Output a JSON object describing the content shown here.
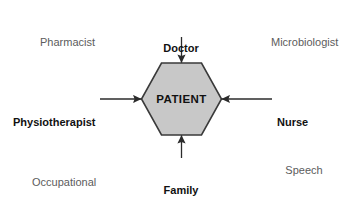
{
  "diagram": {
    "center": {
      "label": "PATIENT",
      "shape": "hexagon",
      "fill_color": "#c8c8c8",
      "stroke_color": "#3a3a3a"
    },
    "arrow_color": "#2b2b2b",
    "connected_roles": [
      {
        "name": "doctor",
        "label": "Doctor",
        "position": "top",
        "arrow_direction": "down",
        "emphasis": "bold"
      },
      {
        "name": "physiotherapist",
        "label": "Physiotherapist",
        "position": "left",
        "arrow_direction": "right",
        "emphasis": "bold"
      },
      {
        "name": "nurse",
        "label": "Nurse",
        "position": "right",
        "arrow_direction": "left",
        "emphasis": "bold"
      },
      {
        "name": "family",
        "label": "Family",
        "position": "bottom",
        "arrow_direction": "up",
        "emphasis": "bold"
      }
    ],
    "corner_roles": [
      {
        "name": "pharmacist",
        "label": "Pharmacist",
        "position": "top-left",
        "emphasis": "regular"
      },
      {
        "name": "microbiologist",
        "label": "Microbiologist",
        "position": "top-right",
        "emphasis": "regular"
      },
      {
        "name": "occupational-therapist",
        "position": "bottom-left",
        "emphasis": "regular",
        "lines": [
          "Occupational",
          "therapist"
        ]
      },
      {
        "name": "speech-and-language-therapist",
        "position": "bottom-right",
        "emphasis": "regular",
        "lines": [
          "Speech",
          "and",
          "language",
          "therapist"
        ]
      }
    ]
  }
}
